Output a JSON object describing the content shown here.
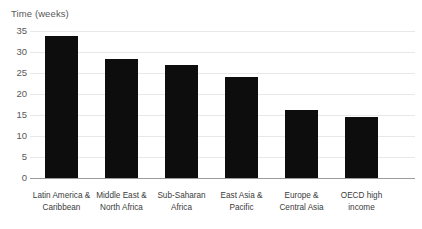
{
  "chart_data": {
    "type": "bar",
    "title": "Time (weeks)",
    "xlabel": "",
    "ylabel": "Time (weeks)",
    "ylim": [
      0,
      35
    ],
    "yticks": [
      0,
      5,
      10,
      15,
      20,
      25,
      30,
      35
    ],
    "grid": true,
    "legend": "none",
    "bar_color": "#0d0d0d",
    "gridline_color": "#e8e8e8",
    "axis_color": "#9c9c9c",
    "label_color": "#58595b",
    "categories": [
      "Latin America & Caribbean",
      "Middle East & North Africa",
      "Sub-Saharan Africa",
      "East Asia & Pacific",
      "Europe & Central Asia",
      "OECD high income"
    ],
    "category_lines": [
      [
        "Latin America &",
        "Caribbean"
      ],
      [
        "Middle East &",
        "North Africa"
      ],
      [
        "Sub-Saharan",
        "Africa"
      ],
      [
        "East Asia &",
        "Pacific"
      ],
      [
        "Europe &",
        "Central Asia"
      ],
      [
        "OECD high",
        "income"
      ]
    ],
    "values": [
      33.8,
      28.3,
      27.0,
      24.1,
      16.1,
      14.5
    ]
  }
}
